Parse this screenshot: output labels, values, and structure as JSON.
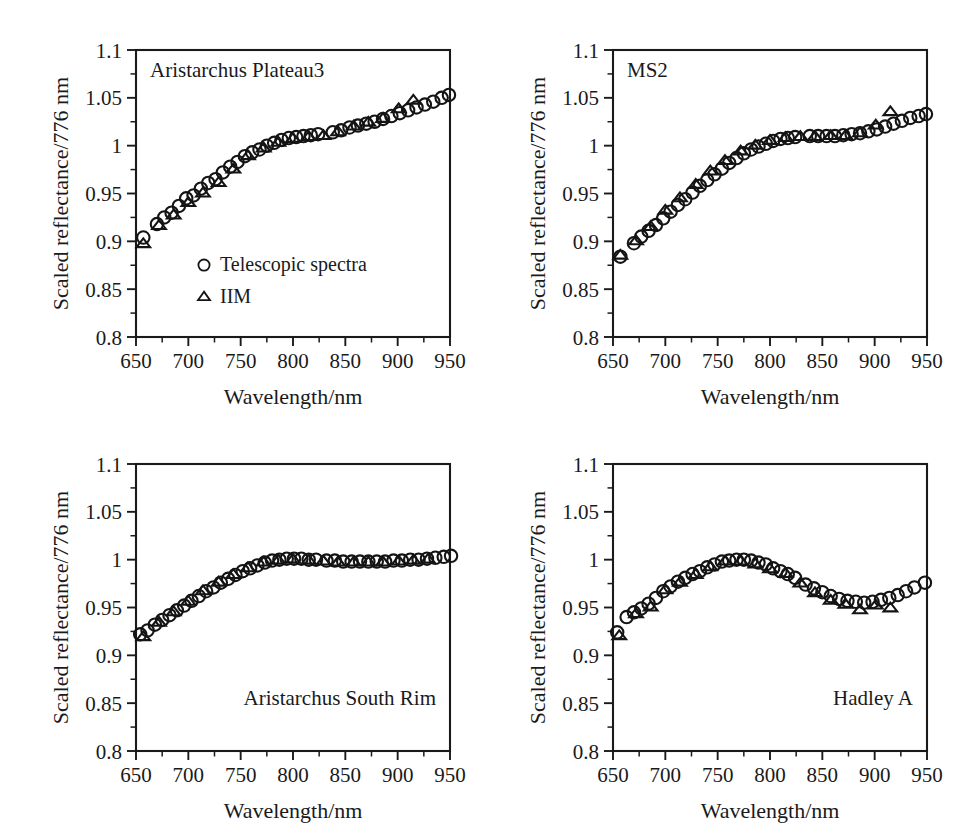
{
  "figure": {
    "background_color": "#ffffff",
    "ink_color": "#1a1a1a",
    "axis_x_label": "Wavelength/nm",
    "axis_y_label": "Scaled reflectance/776 nm",
    "x_ticklabels": [
      "650",
      "700",
      "750",
      "800",
      "850",
      "900",
      "950"
    ],
    "y_ticklabels": [
      "0.8",
      "0.85",
      "0.9",
      "0.95",
      "1",
      "1.05",
      "1.1"
    ],
    "legend": {
      "entries": [
        {
          "marker": "circle-icon",
          "label": "Telescopic spectra"
        },
        {
          "marker": "triangle-icon",
          "label": "IIM"
        }
      ]
    }
  },
  "chart_data": [
    {
      "type": "scatter",
      "title": "Aristarchus Plateau3",
      "title_position": "top-left",
      "xlabel": "Wavelength/nm",
      "ylabel": "Scaled reflectance/776 nm",
      "xlim": [
        650,
        950
      ],
      "ylim": [
        0.8,
        1.1
      ],
      "xticks": [
        650,
        700,
        750,
        800,
        850,
        900,
        950
      ],
      "yticks": [
        0.8,
        0.85,
        0.9,
        0.95,
        1.0,
        1.05,
        1.1
      ],
      "x_minor_step": 25,
      "y_minor_step": 0.025,
      "grid": false,
      "legend_position": "lower-left-inside",
      "series": [
        {
          "name": "Telescopic spectra",
          "marker": "circle",
          "x": [
            657,
            670,
            677,
            684,
            691,
            698,
            705,
            712,
            719,
            726,
            733,
            740,
            747,
            754,
            761,
            768,
            775,
            782,
            789,
            796,
            803,
            810,
            817,
            824,
            838,
            846,
            854,
            862,
            870,
            878,
            886,
            894,
            902,
            910,
            918,
            926,
            934,
            942,
            949
          ],
          "y": [
            0.904,
            0.918,
            0.925,
            0.93,
            0.937,
            0.945,
            0.948,
            0.955,
            0.961,
            0.965,
            0.972,
            0.978,
            0.983,
            0.989,
            0.993,
            0.996,
            1.0,
            1.003,
            1.006,
            1.008,
            1.009,
            1.01,
            1.011,
            1.012,
            1.014,
            1.016,
            1.019,
            1.021,
            1.023,
            1.025,
            1.028,
            1.031,
            1.034,
            1.037,
            1.04,
            1.043,
            1.046,
            1.05,
            1.053
          ]
        },
        {
          "name": "IIM",
          "marker": "triangle",
          "x": [
            657,
            672,
            686,
            700,
            714,
            729,
            743,
            757,
            772,
            786,
            800,
            815,
            829,
            843,
            858,
            872,
            886,
            901,
            915
          ],
          "y": [
            0.898,
            0.917,
            0.928,
            0.941,
            0.951,
            0.962,
            0.976,
            0.99,
            0.998,
            1.004,
            1.008,
            1.01,
            1.011,
            1.015,
            1.021,
            1.025,
            1.029,
            1.039,
            1.048
          ]
        }
      ]
    },
    {
      "type": "scatter",
      "title": "MS2",
      "title_position": "top-left",
      "xlabel": "Wavelength/nm",
      "ylabel": "Scaled reflectance/776 nm",
      "xlim": [
        650,
        950
      ],
      "ylim": [
        0.8,
        1.1
      ],
      "xticks": [
        650,
        700,
        750,
        800,
        850,
        900,
        950
      ],
      "yticks": [
        0.8,
        0.85,
        0.9,
        0.95,
        1.0,
        1.05,
        1.1
      ],
      "x_minor_step": 25,
      "y_minor_step": 0.025,
      "grid": false,
      "series": [
        {
          "name": "Telescopic spectra",
          "marker": "circle",
          "x": [
            657,
            670,
            677,
            684,
            691,
            698,
            705,
            712,
            719,
            726,
            733,
            740,
            747,
            754,
            761,
            768,
            775,
            782,
            789,
            796,
            803,
            810,
            817,
            824,
            838,
            846,
            854,
            862,
            870,
            878,
            886,
            894,
            902,
            910,
            918,
            926,
            934,
            942,
            949
          ],
          "y": [
            0.884,
            0.898,
            0.905,
            0.911,
            0.917,
            0.924,
            0.931,
            0.938,
            0.944,
            0.951,
            0.958,
            0.964,
            0.97,
            0.976,
            0.982,
            0.987,
            0.992,
            0.996,
            0.999,
            1.002,
            1.005,
            1.007,
            1.008,
            1.009,
            1.01,
            1.01,
            1.01,
            1.01,
            1.011,
            1.012,
            1.013,
            1.015,
            1.017,
            1.02,
            1.023,
            1.026,
            1.029,
            1.031,
            1.033
          ]
        },
        {
          "name": "IIM",
          "marker": "triangle",
          "x": [
            657,
            672,
            686,
            700,
            714,
            729,
            743,
            757,
            772,
            786,
            800,
            815,
            829,
            843,
            858,
            872,
            886,
            901,
            915
          ],
          "y": [
            0.886,
            0.901,
            0.916,
            0.933,
            0.946,
            0.96,
            0.974,
            0.985,
            0.995,
            1.001,
            1.006,
            1.009,
            1.01,
            1.01,
            1.011,
            1.011,
            1.014,
            1.022,
            1.036
          ]
        }
      ]
    },
    {
      "type": "scatter",
      "title": "Aristarchus South Rim",
      "title_position": "bottom-right",
      "xlabel": "Wavelength/nm",
      "ylabel": "Scaled reflectance/776 nm",
      "xlim": [
        650,
        950
      ],
      "ylim": [
        0.8,
        1.1
      ],
      "xticks": [
        650,
        700,
        750,
        800,
        850,
        900,
        950
      ],
      "yticks": [
        0.8,
        0.85,
        0.9,
        0.95,
        1.0,
        1.05,
        1.1
      ],
      "x_minor_step": 25,
      "y_minor_step": 0.025,
      "grid": false,
      "series": [
        {
          "name": "Telescopic spectra",
          "marker": "circle",
          "x": [
            654,
            661,
            668,
            675,
            682,
            689,
            696,
            703,
            710,
            717,
            724,
            731,
            738,
            745,
            752,
            759,
            766,
            773,
            780,
            787,
            794,
            801,
            808,
            815,
            822,
            832,
            840,
            848,
            856,
            864,
            872,
            880,
            888,
            896,
            904,
            912,
            920,
            928,
            936,
            944,
            951
          ],
          "y": [
            0.922,
            0.926,
            0.932,
            0.937,
            0.942,
            0.947,
            0.952,
            0.957,
            0.962,
            0.967,
            0.971,
            0.976,
            0.98,
            0.984,
            0.988,
            0.991,
            0.994,
            0.997,
            0.999,
            1.0,
            1.001,
            1.001,
            1.001,
            1.0,
            1.0,
            0.999,
            0.999,
            0.998,
            0.998,
            0.998,
            0.998,
            0.998,
            0.998,
            0.999,
            0.999,
            1.0,
            1.0,
            1.001,
            1.002,
            1.003,
            1.004
          ]
        },
        {
          "name": "IIM",
          "marker": "triangle",
          "x": [
            657,
            672,
            686,
            700,
            714,
            729,
            743,
            757,
            772,
            786,
            800,
            815,
            829,
            843,
            858,
            872,
            886,
            901,
            915,
            929
          ],
          "y": [
            0.92,
            0.935,
            0.946,
            0.957,
            0.968,
            0.977,
            0.985,
            0.992,
            0.998,
            1.0,
            1.001,
            1.0,
            0.999,
            0.998,
            0.998,
            0.998,
            0.998,
            0.999,
            1.0,
            1.001
          ]
        }
      ]
    },
    {
      "type": "scatter",
      "title": "Hadley A",
      "title_position": "bottom-right",
      "xlabel": "Wavelength/nm",
      "ylabel": "Scaled reflectance/776 nm",
      "xlim": [
        650,
        950
      ],
      "ylim": [
        0.8,
        1.1
      ],
      "xticks": [
        650,
        700,
        750,
        800,
        850,
        900,
        950
      ],
      "yticks": [
        0.8,
        0.85,
        0.9,
        0.95,
        1.0,
        1.05,
        1.1
      ],
      "x_minor_step": 25,
      "y_minor_step": 0.025,
      "grid": false,
      "series": [
        {
          "name": "Telescopic spectra",
          "marker": "circle",
          "x": [
            654,
            663,
            670,
            677,
            684,
            691,
            698,
            705,
            712,
            719,
            726,
            733,
            740,
            747,
            754,
            761,
            768,
            775,
            782,
            789,
            796,
            803,
            810,
            817,
            824,
            834,
            842,
            850,
            858,
            866,
            874,
            882,
            890,
            898,
            906,
            914,
            922,
            930,
            938,
            948
          ],
          "y": [
            0.924,
            0.94,
            0.945,
            0.949,
            0.954,
            0.96,
            0.967,
            0.972,
            0.977,
            0.981,
            0.985,
            0.988,
            0.992,
            0.995,
            0.998,
            0.999,
            1.0,
            1.0,
            0.999,
            0.997,
            0.995,
            0.991,
            0.988,
            0.985,
            0.981,
            0.974,
            0.97,
            0.966,
            0.962,
            0.959,
            0.957,
            0.956,
            0.955,
            0.956,
            0.958,
            0.96,
            0.963,
            0.967,
            0.971,
            0.976
          ]
        },
        {
          "name": "IIM",
          "marker": "triangle",
          "x": [
            656,
            672,
            686,
            700,
            714,
            729,
            743,
            757,
            772,
            786,
            800,
            815,
            829,
            843,
            858,
            872,
            886,
            901,
            915
          ],
          "y": [
            0.921,
            0.944,
            0.951,
            0.969,
            0.977,
            0.985,
            0.993,
            0.999,
            0.999,
            0.996,
            0.991,
            0.986,
            0.976,
            0.966,
            0.958,
            0.954,
            0.948,
            0.953,
            0.95
          ]
        }
      ]
    }
  ]
}
